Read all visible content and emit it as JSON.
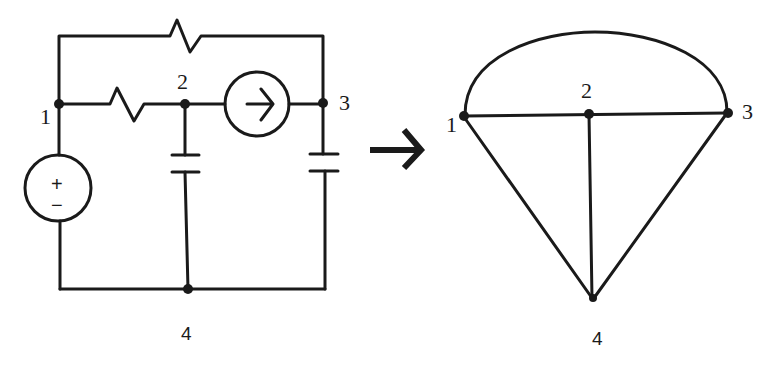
{
  "figure": {
    "circuit": {
      "node_labels": [
        "1",
        "2",
        "3",
        "4"
      ],
      "components": [
        {
          "type": "resistor",
          "between": [
            "1",
            "3"
          ],
          "position": "top branch"
        },
        {
          "type": "resistor",
          "between": [
            "1",
            "2"
          ]
        },
        {
          "type": "current_source",
          "between": [
            "2",
            "3"
          ],
          "direction": "right"
        },
        {
          "type": "capacitor",
          "between": [
            "2",
            "4"
          ]
        },
        {
          "type": "capacitor",
          "between": [
            "3",
            "4"
          ]
        },
        {
          "type": "voltage_source",
          "between": [
            "1",
            "4"
          ],
          "plus_sign": "+",
          "minus_sign": "−"
        }
      ]
    },
    "arrow_icon": "right-arrow-icon",
    "graph": {
      "node_labels": [
        "1",
        "2",
        "3",
        "4"
      ],
      "edges": [
        [
          "1",
          "3",
          "arc"
        ],
        [
          "1",
          "2"
        ],
        [
          "2",
          "3"
        ],
        [
          "2",
          "4"
        ],
        [
          "1",
          "4"
        ],
        [
          "3",
          "4"
        ]
      ]
    }
  },
  "labels": {
    "c1": "1",
    "c2": "2",
    "c3": "3",
    "c4": "4",
    "g1": "1",
    "g2": "2",
    "g3": "3",
    "g4": "4",
    "plus": "+",
    "minus": "−"
  },
  "colors": {
    "ink": "#1a1a1a",
    "background": "#ffffff"
  }
}
